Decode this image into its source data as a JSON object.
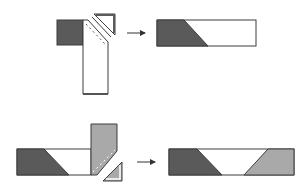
{
  "diagram": {
    "colors": {
      "dark": "#5a5a5a",
      "medium": "#a9a9a9",
      "light": "#ffffff",
      "stroke": "#3c3c3c",
      "arrow": "#333333"
    },
    "steps": [
      {
        "id": "top",
        "before": "Dark square placed beside a vertical light strip; corner of strip stitched on the diagonal and trimmed away (small corner triangle shown removed)",
        "after": "Horizontal strip with dark trapezoid at left, white at right"
      },
      {
        "id": "bottom",
        "before": "Dark/white strip joined to a vertical medium-grey strip; grey corner stitched on the diagonal and trimmed (small corner triangle removed)",
        "after": "Horizontal strip with dark trapezoid left, white centre, medium-grey trapezoid right"
      }
    ]
  }
}
